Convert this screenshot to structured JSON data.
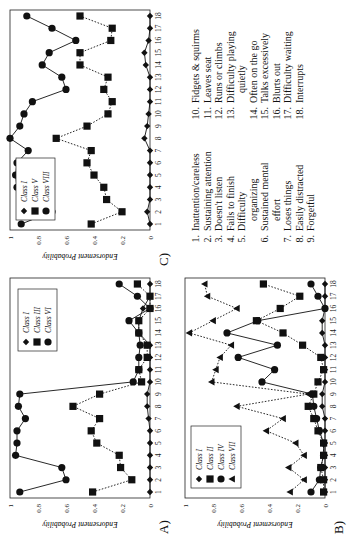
{
  "figure": {
    "panels": [
      {
        "id": "A",
        "label": "A)"
      },
      {
        "id": "B",
        "label": "B)"
      },
      {
        "id": "C",
        "label": "C)"
      }
    ],
    "ylabel": "Endorsement Probability",
    "symptom_list": {
      "left": [
        {
          "num": "1.",
          "text": "Inattention/careless"
        },
        {
          "num": "2.",
          "text": "Sustaining attention"
        },
        {
          "num": "3.",
          "text": "Doesn't listen"
        },
        {
          "num": "4.",
          "text": "Fails to finish"
        },
        {
          "num": "5.",
          "text": "Difficulty"
        },
        {
          "num": "",
          "text": "organizing"
        },
        {
          "num": "6.",
          "text": "Sustained mental"
        },
        {
          "num": "",
          "text": "effort"
        },
        {
          "num": "7.",
          "text": "Loses things"
        },
        {
          "num": "8.",
          "text": "Easily distracted"
        },
        {
          "num": "9.",
          "text": "Forgetful"
        }
      ],
      "right": [
        {
          "num": "10.",
          "text": "Fidgets & squirms"
        },
        {
          "num": "11.",
          "text": "Leaves seat"
        },
        {
          "num": "12.",
          "text": "Runs or climbs"
        },
        {
          "num": "13.",
          "text": "Difficulty playing"
        },
        {
          "num": "",
          "text": "quietly"
        },
        {
          "num": "14.",
          "text": "Often on the go"
        },
        {
          "num": "15.",
          "text": "Talks excessively"
        },
        {
          "num": "16.",
          "text": "Blurts out"
        },
        {
          "num": "17.",
          "text": "Difficulty waiting"
        },
        {
          "num": "18.",
          "text": "Interrupts"
        }
      ]
    }
  },
  "chart_data": [
    {
      "panel": "A",
      "type": "line",
      "x": [
        1,
        2,
        3,
        4,
        5,
        6,
        7,
        8,
        9,
        10,
        11,
        12,
        13,
        14,
        15,
        16,
        17,
        18
      ],
      "xlabel": "",
      "ylabel": "Endorsement Probability",
      "ylim": [
        0,
        1
      ],
      "yticks": [
        0,
        0.2,
        0.4,
        0.6,
        0.8,
        1
      ],
      "legend_position": "upper right",
      "series": [
        {
          "name": "Class I",
          "marker": "diamond",
          "line": "solid",
          "values": [
            0,
            0,
            0,
            0,
            0,
            0,
            0.01,
            0.02,
            0.02,
            0,
            0,
            0,
            0,
            0.08,
            0.08,
            0.05,
            0,
            0
          ]
        },
        {
          "name": "Class III",
          "marker": "square",
          "line": "dotted",
          "values": [
            0.41,
            0.13,
            0.21,
            0.22,
            0.38,
            0.42,
            0.36,
            0.55,
            0.36,
            0.06,
            0.08,
            0.02,
            0.02,
            0.08,
            0.08,
            0,
            0,
            0.09
          ]
        },
        {
          "name": "Class VI",
          "marker": "circle",
          "line": "solid",
          "values": [
            0.93,
            0.6,
            0.63,
            0.96,
            0.95,
            0.95,
            0.89,
            0.94,
            0.93,
            0.12,
            0.08,
            0.08,
            0.07,
            0.08,
            0.15,
            0,
            0.09,
            0.22
          ]
        }
      ]
    },
    {
      "panel": "B",
      "type": "line",
      "x": [
        1,
        2,
        3,
        4,
        5,
        6,
        7,
        8,
        9,
        10,
        11,
        12,
        13,
        14,
        15,
        16,
        17,
        18
      ],
      "xlabel": "",
      "ylabel": "Endorsement Probability",
      "ylim": [
        0,
        1
      ],
      "yticks": [
        0,
        0.2,
        0.4,
        0.6,
        0.8,
        1
      ],
      "legend_position": "upper left",
      "series": [
        {
          "name": "Class I",
          "marker": "diamond",
          "line": "solid",
          "values": [
            0,
            0,
            0,
            0,
            0,
            0,
            0,
            0.02,
            0.02,
            0,
            0,
            0,
            0,
            0.02,
            0.02,
            0,
            0,
            0
          ]
        },
        {
          "name": "Class II",
          "marker": "square",
          "line": "dotted",
          "values": [
            0.01,
            0.01,
            0.03,
            0.01,
            0.01,
            0.05,
            0.08,
            0.12,
            0.08,
            0.05,
            0.01,
            0.03,
            0.16,
            0.3,
            0.49,
            0.32,
            0.18,
            0.44
          ]
        },
        {
          "name": "Class IV",
          "marker": "circle",
          "line": "solid",
          "values": [
            0.1,
            0.04,
            0.03,
            0.01,
            0.01,
            0.04,
            0.06,
            0.08,
            0.09,
            0.45,
            0.36,
            0.62,
            0.34,
            0.7,
            0.48,
            0,
            0.05,
            0.1
          ]
        },
        {
          "name": "Class VII",
          "marker": "triangle",
          "line": "dotted",
          "values": [
            0.25,
            0.15,
            0.26,
            0.15,
            0.21,
            0.42,
            0.3,
            0.63,
            0.12,
            0.81,
            0.78,
            0.75,
            0.67,
            0.97,
            0.8,
            0.63,
            0.84,
            0.86
          ]
        }
      ]
    },
    {
      "panel": "C",
      "type": "line",
      "x": [
        1,
        2,
        3,
        4,
        5,
        6,
        7,
        8,
        9,
        10,
        11,
        12,
        13,
        14,
        15,
        16,
        17,
        18
      ],
      "xlabel": "",
      "ylabel": "Endorsement Probability",
      "ylim": [
        0,
        1
      ],
      "yticks": [
        0,
        0.2,
        0.4,
        0.6,
        0.8,
        1
      ],
      "legend_position": "upper left",
      "series": [
        {
          "name": "Class I",
          "marker": "diamond",
          "line": "solid",
          "values": [
            0,
            0.02,
            0,
            0,
            0,
            0,
            0,
            0.04,
            0.02,
            0.01,
            0,
            0,
            0,
            0.03,
            0.04,
            0.01,
            0,
            0
          ]
        },
        {
          "name": "Class V",
          "marker": "square",
          "line": "dotted",
          "values": [
            0.42,
            0.2,
            0.31,
            0.33,
            0.4,
            0.45,
            0.42,
            0.67,
            0.45,
            0.3,
            0.27,
            0.33,
            0.3,
            0.5,
            0.5,
            0.28,
            0.27,
            0.5
          ]
        },
        {
          "name": "Class VIII",
          "marker": "circle",
          "line": "solid",
          "values": [
            0.92,
            0.7,
            0.9,
            0.95,
            0.96,
            0.95,
            0.87,
            1.0,
            0.93,
            0.9,
            0.84,
            0.6,
            0.63,
            0.77,
            0.72,
            0.53,
            0.7,
            0.88
          ]
        }
      ]
    }
  ]
}
